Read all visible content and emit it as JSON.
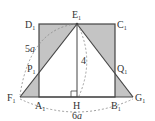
{
  "diagram": {
    "type": "geometry-figure",
    "colors": {
      "stroke": "#444444",
      "shade": "#c4c4c4",
      "dashed": "#888888",
      "text": "#333333",
      "background": "#ffffff"
    },
    "points": {
      "D1": {
        "name": "D",
        "sub": "1"
      },
      "E1": {
        "name": "E",
        "sub": "1"
      },
      "C1": {
        "name": "C",
        "sub": "1"
      },
      "P1": {
        "name": "P",
        "sub": "1"
      },
      "Q1": {
        "name": "Q",
        "sub": "1"
      },
      "F1": {
        "name": "F",
        "sub": "1"
      },
      "A1": {
        "name": "A",
        "sub": "1"
      },
      "H": {
        "name": "H",
        "sub": ""
      },
      "B1": {
        "name": "B",
        "sub": "1"
      },
      "G1": {
        "name": "G",
        "sub": "1"
      }
    },
    "measurements": {
      "slant_label_num": "5",
      "slant_label_var": "a",
      "height_label": "4",
      "base_label_num": "6",
      "base_label_var": "a"
    },
    "annotations": {
      "right_angle_at": "H"
    }
  }
}
